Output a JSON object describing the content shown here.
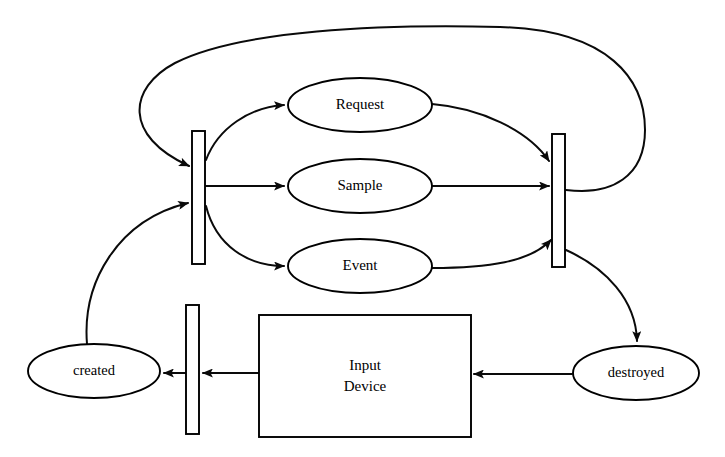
{
  "diagram": {
    "type": "state-activity-diagram",
    "background_color": "#ffffff",
    "line_color": "#000000",
    "nodes": {
      "request": {
        "label": "Request",
        "shape": "ellipse",
        "cx": 360,
        "cy": 105,
        "rx": 72,
        "ry": 27
      },
      "sample": {
        "label": "Sample",
        "shape": "ellipse",
        "cx": 360,
        "cy": 186,
        "rx": 72,
        "ry": 27
      },
      "event": {
        "label": "Event",
        "shape": "ellipse",
        "cx": 360,
        "cy": 266,
        "rx": 72,
        "ry": 27
      },
      "created": {
        "label": "created",
        "shape": "ellipse",
        "cx": 94,
        "cy": 371,
        "rx": 66,
        "ry": 27
      },
      "destroyed": {
        "label": "destroyed",
        "shape": "ellipse",
        "cx": 636,
        "cy": 373,
        "rx": 63,
        "ry": 27
      },
      "input_device": {
        "label_line1": "Input",
        "label_line2": "Device",
        "shape": "rectangle",
        "x": 259,
        "y": 315,
        "width": 212,
        "height": 122
      }
    },
    "bars": [
      {
        "name": "fork-bar-left",
        "x": 192,
        "y": 131,
        "width": 13,
        "height": 133
      },
      {
        "name": "join-bar-right",
        "x": 552,
        "y": 134,
        "width": 13,
        "height": 133
      },
      {
        "name": "sync-bar-bottom",
        "x": 186,
        "y": 305,
        "width": 13,
        "height": 129
      }
    ],
    "edges": [
      {
        "from": "fork-bar-left",
        "to": "request",
        "arrow": true
      },
      {
        "from": "fork-bar-left",
        "to": "sample",
        "arrow": true
      },
      {
        "from": "fork-bar-left",
        "to": "event",
        "arrow": true
      },
      {
        "from": "request",
        "to": "join-bar-right",
        "arrow": true
      },
      {
        "from": "sample",
        "to": "join-bar-right",
        "arrow": true
      },
      {
        "from": "event",
        "to": "join-bar-right",
        "arrow": true
      },
      {
        "from": "join-bar-right",
        "to": "fork-bar-left",
        "arrow": true,
        "style": "loop-over-top"
      },
      {
        "from": "join-bar-right",
        "to": "destroyed",
        "arrow": true
      },
      {
        "from": "destroyed",
        "to": "input_device",
        "arrow": true
      },
      {
        "from": "input_device",
        "to": "sync-bar-bottom",
        "arrow": true
      },
      {
        "from": "sync-bar-bottom",
        "to": "created",
        "arrow": true
      },
      {
        "from": "created",
        "to": "fork-bar-left",
        "arrow": true
      }
    ]
  }
}
